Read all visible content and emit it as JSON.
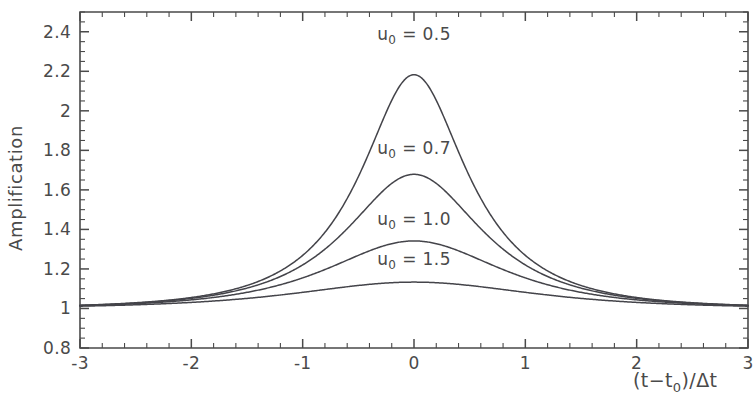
{
  "chart_data": {
    "type": "line",
    "title": "",
    "xlabel": "(t−t₀)/Δt",
    "ylabel": "Amplification",
    "xlim": [
      -3,
      3
    ],
    "ylim": [
      0.8,
      2.5
    ],
    "grid": false,
    "legend_position": "inline-annotations",
    "x_ticks": [
      -3,
      -2,
      -1,
      0,
      1,
      2,
      3
    ],
    "x_tick_labels": [
      "-3",
      "-2",
      "-1",
      "0",
      "1",
      "2",
      "3"
    ],
    "x_minor_tick_step": 0.2,
    "y_ticks": [
      0.8,
      1,
      1.2,
      1.4,
      1.6,
      1.8,
      2,
      2.2,
      2.4
    ],
    "y_tick_labels": [
      "0.8",
      "1",
      "1.2",
      "1.4",
      "1.6",
      "1.8",
      "2",
      "2.2",
      "2.4"
    ],
    "y_minor_tick_step": 0.05,
    "y_top_unlabeled": 2.5,
    "formula": "A(u) = (u^2+2)/(u*sqrt(u^2+4)), u = sqrt(u0^2 + x^2)",
    "series": [
      {
        "name": "u₀ = 0.5",
        "u0": 0.5,
        "peak_value": 2.19,
        "peak_x": 0,
        "label_x": 0.0,
        "label_y": 2.36,
        "color": "#44444a"
      },
      {
        "name": "u₀ = 0.7",
        "u0": 0.7,
        "peak_value": 1.68,
        "peak_x": 0,
        "label_x": 0.0,
        "label_y": 1.78,
        "color": "#44444a"
      },
      {
        "name": "u₀ = 1.0",
        "u0": 1.0,
        "peak_value": 1.34,
        "peak_x": 0,
        "label_x": 0.0,
        "label_y": 1.42,
        "color": "#44444a"
      },
      {
        "name": "u₀ = 1.5",
        "u0": 1.5,
        "peak_value": 1.13,
        "peak_x": 0,
        "label_x": 0.0,
        "label_y": 1.22,
        "color": "#44444a"
      }
    ],
    "edge_values_at_x_minus3": [
      1.016,
      1.017,
      1.02,
      1.027
    ]
  },
  "annotations": [
    {
      "base": "u",
      "sub": "0",
      "rest": " = 0.5"
    },
    {
      "base": "u",
      "sub": "0",
      "rest": " = 0.7"
    },
    {
      "base": "u",
      "sub": "0",
      "rest": " = 1.0"
    },
    {
      "base": "u",
      "sub": "0",
      "rest": " = 1.5"
    }
  ],
  "axis_label_parts": {
    "x_open": "(t−t",
    "x_sub": "0",
    "x_close": ")/Δt"
  },
  "colors": {
    "background": "#ffffff",
    "axis": "#4a4a4a",
    "curve": "#44444a",
    "text": "#4a4a4a"
  }
}
